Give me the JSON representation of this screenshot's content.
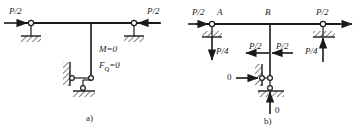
{
  "figure": {
    "caption_a": "a)",
    "caption_b": "b)",
    "panel_a": {
      "load_left": "P/2",
      "load_right": "P/2",
      "moment_zero": "M=0",
      "shear_zero_main": "F",
      "shear_zero_sub": "Q",
      "shear_zero_tail": "=0"
    },
    "panel_b": {
      "load_left": "P/2",
      "load_right": "P/2",
      "node_a": "A",
      "node_b": "B",
      "reaction_left": "P/4",
      "reaction_right": "P/4",
      "shear_left": "P/2",
      "shear_right": "P/2",
      "zero_horizontal": "0",
      "zero_vertical": "0"
    }
  },
  "colors": {
    "line": "#1a1a1a",
    "text": "#1a1a1a",
    "background": "#ffffff"
  }
}
